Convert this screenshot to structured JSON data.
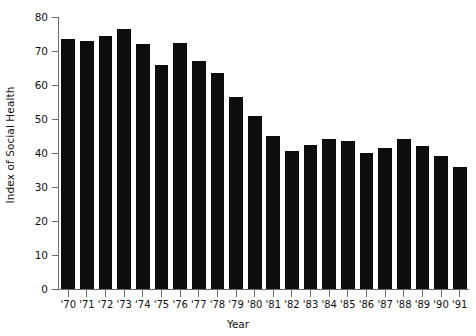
{
  "chart_data": {
    "type": "bar",
    "title": "",
    "xlabel": "Year",
    "ylabel": "Index of Social Health",
    "categories": [
      "'70",
      "'71",
      "'72",
      "'73",
      "'74",
      "'75",
      "'76",
      "'77",
      "'78",
      "'79",
      "'80",
      "'81",
      "'82",
      "'83",
      "'84",
      "'85",
      "'86",
      "'87",
      "'88",
      "'89",
      "'90",
      "'91"
    ],
    "values": [
      73.5,
      73,
      74.5,
      76.5,
      72,
      66,
      72.5,
      67,
      63.5,
      56.5,
      51,
      45,
      40.5,
      42.5,
      44,
      43.5,
      40,
      41.5,
      44,
      42,
      39,
      36
    ],
    "series": [
      {
        "name": "Index of Social Health",
        "values": [
          73.5,
          73,
          74.5,
          76.5,
          72,
          66,
          72.5,
          67,
          63.5,
          56.5,
          51,
          45,
          40.5,
          42.5,
          44,
          43.5,
          40,
          41.5,
          44,
          42,
          39,
          36
        ]
      }
    ],
    "ylim": [
      0,
      80
    ],
    "yticks": [
      0,
      10,
      20,
      30,
      40,
      50,
      60,
      70,
      80
    ],
    "ytick_labels": [
      "0",
      "10",
      "20",
      "30",
      "40",
      "50",
      "60",
      "70",
      "80"
    ],
    "grid": false,
    "legend": "none",
    "bar_color": "#0d0d0d",
    "axis_color": "#6b6b6b"
  }
}
